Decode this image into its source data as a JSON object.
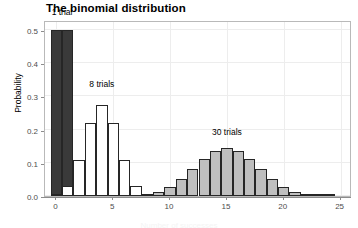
{
  "chart_data": {
    "type": "bar",
    "title": "The binomial distribution",
    "xlabel": "Number of successes",
    "ylabel": "Probability",
    "xlim": [
      -1.0,
      26.0
    ],
    "ylim": [
      0.0,
      0.53
    ],
    "grid": true,
    "legend_position": "none",
    "x_ticks": [
      0,
      5,
      10,
      15,
      20,
      25
    ],
    "x_tick_labels": [
      "0",
      "5",
      "10",
      "15",
      "20",
      "25"
    ],
    "y_ticks": [
      0.0,
      0.1,
      0.2,
      0.3,
      0.4,
      0.5
    ],
    "y_tick_labels": [
      "0.0",
      "0.1",
      "0.2",
      "0.3",
      "0.4",
      "0.5"
    ],
    "annotations": [
      {
        "text": "1 trial",
        "x": 0.5,
        "y": 0.535
      },
      {
        "text": "8 trials",
        "x": 4.0,
        "y": 0.32
      },
      {
        "text": "30 trials",
        "x": 15.0,
        "y": 0.175
      }
    ],
    "series": [
      {
        "name": "1 trial",
        "fill": "#3a3a3a",
        "edge": "#262626",
        "x": [
          0,
          1
        ],
        "values": [
          0.5,
          0.5
        ]
      },
      {
        "name": "8 trials",
        "fill": "#ffffff",
        "edge": "#262626",
        "x": [
          0,
          1,
          2,
          3,
          4,
          5,
          6,
          7,
          8
        ],
        "values": [
          0.0039,
          0.0313,
          0.1094,
          0.2188,
          0.2734,
          0.2188,
          0.1094,
          0.0313,
          0.0039
        ]
      },
      {
        "name": "30 trials",
        "fill": "#bfbfbf",
        "edge": "#262626",
        "x": [
          8,
          9,
          10,
          11,
          12,
          13,
          14,
          15,
          16,
          17,
          18,
          19,
          20,
          21,
          22,
          23,
          24
        ],
        "values": [
          0.0019,
          0.0133,
          0.028,
          0.0509,
          0.0806,
          0.1115,
          0.1354,
          0.1445,
          0.1354,
          0.1115,
          0.0806,
          0.0509,
          0.028,
          0.0133,
          0.0055,
          0.0019,
          0.0006
        ]
      }
    ]
  }
}
